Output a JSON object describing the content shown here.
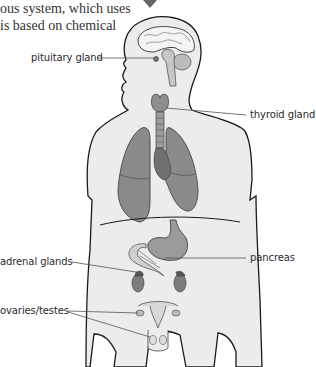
{
  "intro_text": {
    "line1": "ous system, which uses",
    "line2": "is based on chemical"
  },
  "labels": {
    "pituitary": "pituitary gland",
    "thyroid": "thyroid gland",
    "adrenal": "adrenal glands",
    "pancreas": "pancreas",
    "ovaries": "ovaries/testes"
  },
  "icons": {
    "arrow": "down-arrow-icon"
  },
  "colors": {
    "body_fill": "#ececec",
    "outline": "#1a1a1a",
    "organ_dark": "#8a8a8a",
    "organ_mid": "#a9a9a9",
    "organ_light": "#c4c4c4",
    "leader": "#555555"
  }
}
